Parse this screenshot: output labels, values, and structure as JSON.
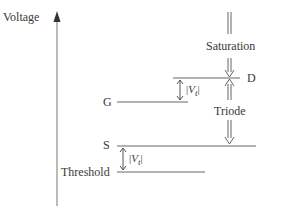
{
  "axis": {
    "label": "Voltage"
  },
  "terminals": {
    "drain": "D",
    "gate": "G",
    "source": "S",
    "threshold": "Threshold"
  },
  "regions": {
    "saturation": "Saturation",
    "triode": "Triode"
  },
  "annotations": {
    "vt_upper_open": "|",
    "vt_upper_sym": "V",
    "vt_upper_sub": "t",
    "vt_upper_close": "|",
    "vt_lower_open": "|",
    "vt_lower_sym": "V",
    "vt_lower_sub": "t",
    "vt_lower_close": "|"
  },
  "colors": {
    "line": "#666666",
    "text": "#3a3a3a"
  }
}
